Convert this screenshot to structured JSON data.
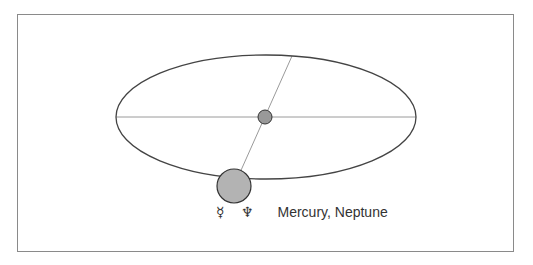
{
  "diagram": {
    "caption": {
      "symbols": "☿ ♆",
      "label": "Mercury, Neptune"
    },
    "orbit": {
      "cx": 266,
      "cy": 117,
      "rx": 150,
      "ry": 62,
      "stroke": "#444444"
    },
    "sun": {
      "cx": 265,
      "cy": 117,
      "r": 7,
      "fill": "#999999"
    },
    "planet": {
      "cx": 234,
      "cy": 186,
      "r": 17,
      "fill": "#b3b3b3"
    },
    "axis_line_color": "#999999"
  }
}
